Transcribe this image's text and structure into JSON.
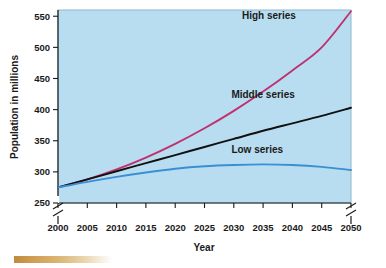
{
  "chart_data": {
    "type": "line",
    "title": "",
    "xlabel": "Year",
    "ylabel": "Population in millions",
    "xlim": [
      2000,
      2050
    ],
    "ylim": [
      250,
      560
    ],
    "y_axis_break": true,
    "grid": false,
    "legend_position": "inline-labels",
    "background_color": "#b8ddf0",
    "x": [
      2000,
      2005,
      2010,
      2015,
      2020,
      2025,
      2030,
      2035,
      2040,
      2045,
      2050
    ],
    "xticklabels": [
      "2000",
      "2005",
      "2010",
      "2015",
      "2020",
      "2025",
      "2030",
      "2035",
      "2040",
      "2045",
      "2050"
    ],
    "yticks": [
      250,
      300,
      350,
      400,
      450,
      500,
      550
    ],
    "yticklabels": [
      "250",
      "300",
      "350",
      "400",
      "450",
      "500",
      "550"
    ],
    "series": [
      {
        "name": "High series",
        "color": "#c0306e",
        "values": [
          275,
          288,
          304,
          323,
          345,
          370,
          398,
          429,
          463,
          500,
          558
        ]
      },
      {
        "name": "Middle series",
        "color": "#111111",
        "values": [
          275,
          288,
          301,
          314,
          327,
          340,
          353,
          366,
          378,
          390,
          403
        ]
      },
      {
        "name": "Low series",
        "color": "#3a8fd4",
        "values": [
          275,
          284,
          292,
          299,
          305,
          309,
          311,
          312,
          311,
          308,
          303
        ]
      }
    ],
    "annotations": [
      {
        "text": "High series",
        "x": 2036,
        "y": 545
      },
      {
        "text": "Middle series",
        "x": 2035,
        "y": 418
      },
      {
        "text": "Low series",
        "x": 2034,
        "y": 330
      }
    ]
  }
}
